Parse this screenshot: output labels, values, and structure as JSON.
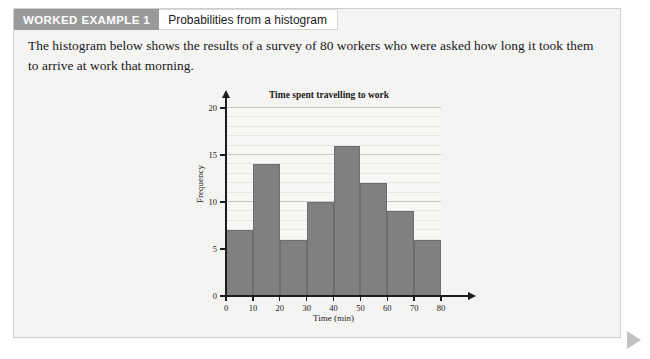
{
  "panel": {
    "header": {
      "tag": "WORKED EXAMPLE 1",
      "title": "Probabilities from a histogram"
    },
    "paragraph": "The histogram below shows the results of a survey of 80 workers who were asked how long it took them to arrive at work that morning."
  },
  "chart_data": {
    "type": "bar",
    "title": "Time spent travelling to work",
    "xlabel": "Time (min)",
    "ylabel": "Frequency",
    "categories": [
      "0-10",
      "10-20",
      "20-30",
      "30-40",
      "40-50",
      "50-60",
      "60-70",
      "70-80"
    ],
    "bin_edges": [
      0,
      10,
      20,
      30,
      40,
      50,
      60,
      70,
      80
    ],
    "values": [
      7,
      14,
      6,
      10,
      16,
      12,
      9,
      6
    ],
    "total": 80,
    "xlim": [
      0,
      80
    ],
    "ylim": [
      0,
      20
    ],
    "xticks": [
      "0",
      "10",
      "20",
      "30",
      "40",
      "50",
      "60",
      "70",
      "80"
    ],
    "xtick_values": [
      0,
      10,
      20,
      30,
      40,
      50,
      60,
      70,
      80
    ],
    "yticks": [
      "0",
      "5",
      "10",
      "15",
      "20"
    ],
    "ytick_values": [
      0,
      5,
      10,
      15,
      20
    ],
    "grid": true,
    "legend": null,
    "bar_color": "#808080",
    "plot_background": "#f7f7f5",
    "axis_color": "#1c1c1c"
  },
  "colors": {
    "tag_background": "#9a9a9a",
    "tag_text": "#ffffff",
    "panel_background": "#f4f4f2",
    "next_arrow": "#c2c2c2"
  },
  "footer": {
    "next_icon": "play-triangle-icon"
  }
}
